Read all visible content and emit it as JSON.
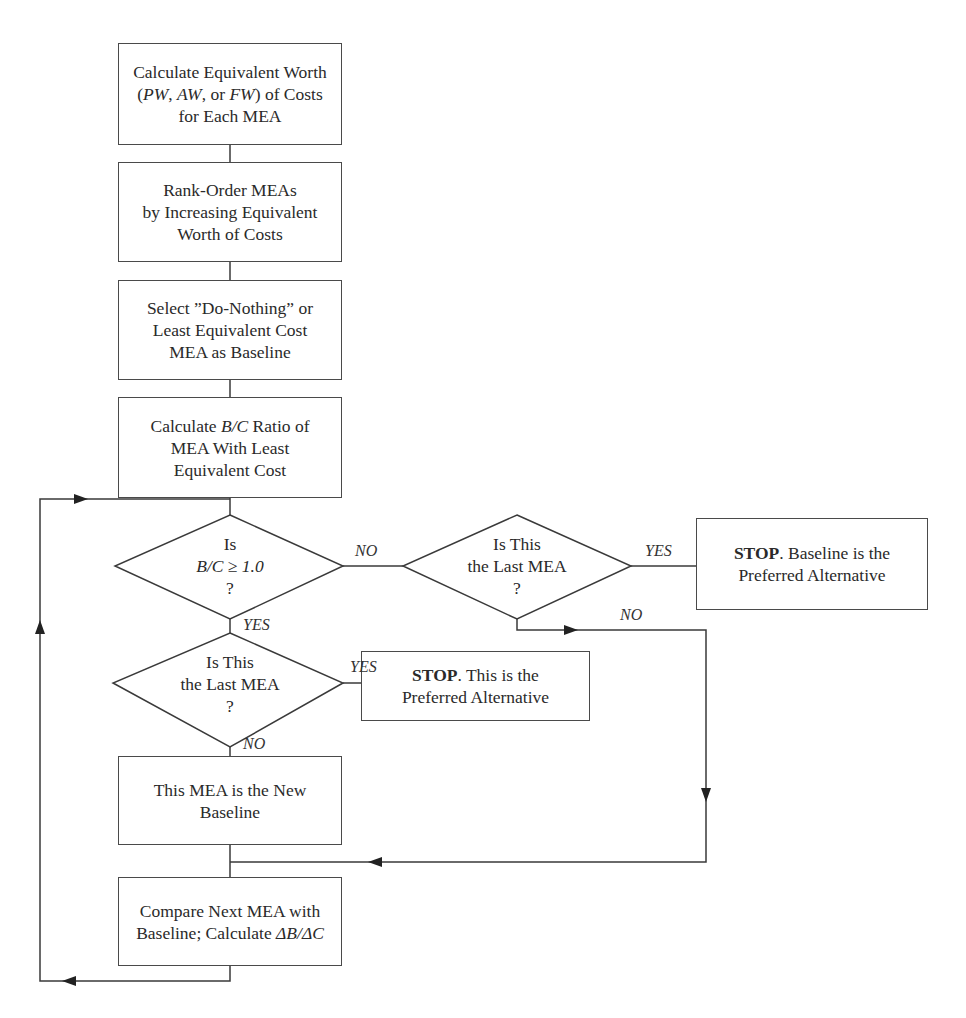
{
  "diagram": {
    "type": "flowchart",
    "nodes": {
      "step1": {
        "line1": "Calculate Equivalent Worth",
        "line2_pre": "(",
        "line2_pw": "PW",
        "line2_sep1": ", ",
        "line2_aw": "AW",
        "line2_sep2": ", or ",
        "line2_fw": "FW",
        "line2_post": ") of Costs",
        "line3": "for Each MEA"
      },
      "step2": {
        "line1": "Rank-Order MEAs",
        "line2": "by Increasing Equivalent",
        "line3": "Worth of Costs"
      },
      "step3": {
        "line1": "Select ”Do-Nothing” or",
        "line2": "Least Equivalent Cost",
        "line3": "MEA as Baseline"
      },
      "step4": {
        "line1_pre": "Calculate ",
        "line1_ratio": "B/C",
        "line1_post": " Ratio of",
        "line2": "MEA With Least",
        "line3": "Equivalent Cost"
      },
      "decision_bc": {
        "line1": "Is",
        "line2": "B/C ≥ 1.0",
        "line3": "?"
      },
      "decision_last_right": {
        "line1": "Is This",
        "line2": "the Last MEA",
        "line3": "?"
      },
      "stop_baseline": {
        "bold": "STOP",
        "line1_rest": ". Baseline is the",
        "line2": "Preferred Alternative"
      },
      "decision_last_left": {
        "line1": "Is This",
        "line2": "the Last MEA",
        "line3": "?"
      },
      "stop_this": {
        "bold": "STOP",
        "line1_rest": ". This is the",
        "line2": "Preferred Alternative"
      },
      "new_baseline": {
        "line1": "This MEA is the New",
        "line2": "Baseline"
      },
      "compare": {
        "line1": "Compare Next MEA with",
        "line2_pre": "Baseline; Calculate ",
        "line2_ratio": "ΔB/ΔC"
      }
    },
    "edge_labels": {
      "bc_no": "NO",
      "bc_yes": "YES",
      "last_right_yes": "YES",
      "last_right_no": "NO",
      "last_left_yes": "YES",
      "last_left_no": "NO"
    },
    "colors": {
      "line": "#3a3a3a",
      "text": "#2a2a2a",
      "background": "#ffffff"
    }
  }
}
